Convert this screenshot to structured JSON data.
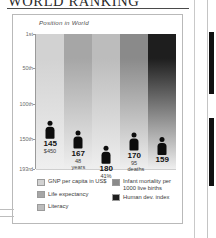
{
  "document": {
    "title": "WORLD RANKING"
  },
  "chart": {
    "axis_title": "Position in World",
    "y_ticks": [
      "1st",
      "50th",
      "100th",
      "150th",
      "193rd"
    ]
  },
  "legend": {
    "left": [
      {
        "label": "GNP per capita in US$",
        "color": "#d2d2d2",
        "swatch_name": "legend-swatch-gnp"
      },
      {
        "label": "Life expectancy",
        "color": "#a6a6a6",
        "swatch_name": "legend-swatch-life-expectancy"
      },
      {
        "label": "Literacy",
        "color": "#bcbcbc",
        "swatch_name": "legend-swatch-literacy"
      }
    ],
    "right": [
      {
        "label": "Infant mortality per\n1000 live births",
        "color": "#8a8a8a",
        "swatch_name": "legend-swatch-infant-mortality"
      },
      {
        "label": "Human dev. index",
        "color": "#1e1e1e",
        "swatch_name": "legend-swatch-hdi"
      }
    ]
  },
  "chart_data": {
    "type": "bar",
    "title": "WORLD RANKING",
    "subtitle": "Position in World",
    "xlabel": "",
    "ylabel": "Position in World",
    "ylim": [
      1,
      193
    ],
    "y_inverted": true,
    "grid": true,
    "ytick_labels": [
      "1st",
      "50th",
      "100th",
      "150th",
      "193rd"
    ],
    "ytick_values": [
      1,
      50,
      100,
      150,
      193
    ],
    "legend_position": "below",
    "categories": [
      "GNP per capita in US$",
      "Life expectancy",
      "Literacy",
      "Infant mortality per 1000 live births",
      "Human dev. index"
    ],
    "values": [
      145,
      167,
      180,
      170,
      159
    ],
    "value_labels": [
      "145",
      "167",
      "180",
      "170",
      "159"
    ],
    "sub_labels": [
      "$450",
      "48\nyears",
      "41%",
      "95\ndeaths",
      ""
    ],
    "bar_colors": [
      "#d2d2d2",
      "#a6a6a6",
      "#bcbcbc",
      "#8a8a8a",
      "#1e1e1e"
    ],
    "series": [
      {
        "name": "Position in World",
        "points": [
          {
            "category": "GNP per capita in US$",
            "rank": 145,
            "label": "145",
            "sub": "$450",
            "color": "#d2d2d2"
          },
          {
            "category": "Life expectancy",
            "rank": 167,
            "label": "167",
            "sub": "48\nyears",
            "color": "#a6a6a6"
          },
          {
            "category": "Literacy",
            "rank": 180,
            "label": "180",
            "sub": "41%",
            "color": "#bcbcbc"
          },
          {
            "category": "Infant mortality per 1000 live births",
            "rank": 170,
            "label": "170",
            "sub": "95\ndeaths",
            "color": "#8a8a8a"
          },
          {
            "category": "Human dev. index",
            "rank": 159,
            "label": "159",
            "sub": "",
            "color": "#1e1e1e"
          }
        ]
      }
    ]
  }
}
